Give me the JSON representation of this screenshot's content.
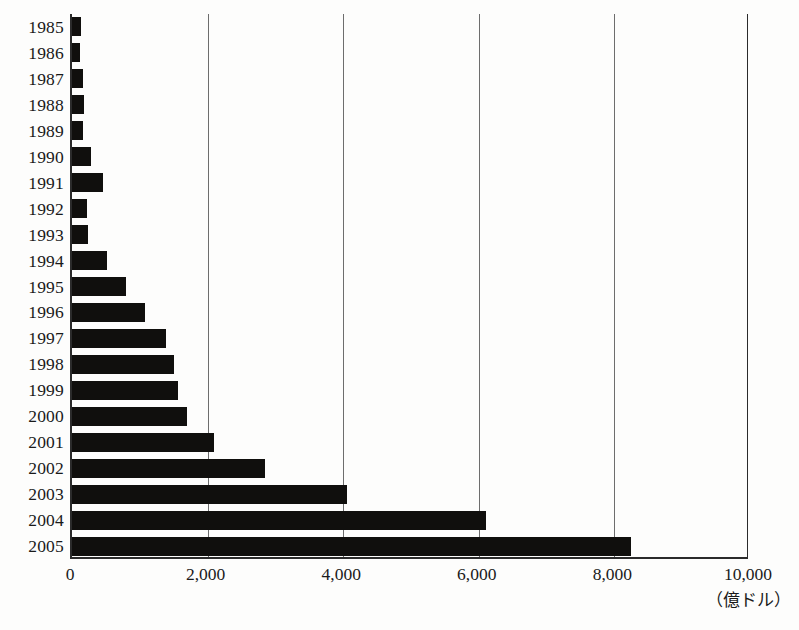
{
  "chart_data": {
    "type": "bar",
    "orientation": "horizontal",
    "title": "",
    "subtitle": "",
    "xlabel": "",
    "ylabel": "",
    "unit_note": "（億ドル）",
    "xlim": [
      0,
      10000
    ],
    "ylim_categories_order": "top-to-bottom",
    "grid": true,
    "grid_axis": "x",
    "legend": null,
    "legend_position": "none",
    "categories": [
      "1985",
      "1986",
      "1987",
      "1988",
      "1989",
      "1990",
      "1991",
      "1992",
      "1993",
      "1994",
      "1995",
      "1996",
      "1997",
      "1998",
      "1999",
      "2000",
      "2001",
      "2002",
      "2003",
      "2004",
      "2005"
    ],
    "values": [
      130,
      120,
      160,
      175,
      165,
      285,
      450,
      215,
      240,
      510,
      790,
      1080,
      1390,
      1500,
      1570,
      1700,
      2100,
      2850,
      4050,
      6100,
      8250
    ],
    "xticks": [
      0,
      2000,
      4000,
      6000,
      8000,
      10000
    ],
    "xticklabels": [
      "0",
      "2,000",
      "4,000",
      "6,000",
      "8,000",
      "10,000"
    ],
    "bar_color": "#100f0d",
    "gridline_color": "#6d6d6d",
    "axis_color": "#2b2b2b",
    "background_color": "#fdfdfc"
  }
}
